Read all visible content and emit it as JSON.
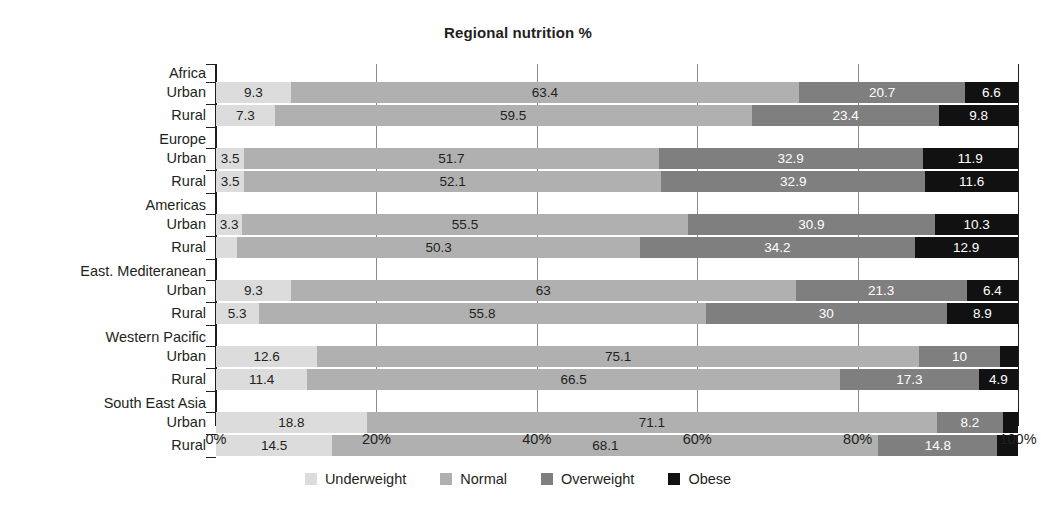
{
  "chart_data": {
    "type": "bar",
    "subtype": "stacked-horizontal-100",
    "title": "Regional nutrition %",
    "xlabel": "",
    "ylabel": "",
    "xlim": [
      0,
      100
    ],
    "xticks": [
      "0%",
      "20%",
      "40%",
      "60%",
      "80%",
      "100%"
    ],
    "xtick_values": [
      0,
      20,
      40,
      60,
      80,
      100
    ],
    "grid": true,
    "legend_position": "bottom",
    "series": [
      {
        "name": "Underweight",
        "color": "#dcdcdc",
        "values": [
          9.3,
          7.3,
          3.5,
          3.5,
          3.3,
          2.6,
          9.3,
          5.3,
          12.6,
          11.4,
          18.8,
          14.5
        ]
      },
      {
        "name": "Normal",
        "color": "#b0b0b0",
        "values": [
          63.4,
          59.5,
          51.7,
          52.1,
          55.5,
          50.3,
          63,
          55.8,
          75.1,
          66.5,
          71.1,
          68.1
        ]
      },
      {
        "name": "Overweight",
        "color": "#7f7f7f",
        "values": [
          20.7,
          23.4,
          32.9,
          32.9,
          30.9,
          34.2,
          21.3,
          30,
          10,
          17.3,
          8.2,
          14.8
        ]
      },
      {
        "name": "Obese",
        "color": "#111111",
        "values": [
          6.6,
          9.8,
          11.9,
          11.6,
          10.3,
          12.9,
          6.4,
          8.9,
          2.3,
          4.9,
          1.9,
          2.6
        ]
      }
    ],
    "groups": [
      {
        "region": "Africa",
        "rows": [
          "Urban",
          "Rural"
        ]
      },
      {
        "region": "Europe",
        "rows": [
          "Urban",
          "Rural"
        ]
      },
      {
        "region": "Americas",
        "rows": [
          "Urban",
          "Rural"
        ]
      },
      {
        "region": "East. Mediteranean",
        "rows": [
          "Urban",
          "Rural"
        ]
      },
      {
        "region": "Western Pacific",
        "rows": [
          "Urban",
          "Rural"
        ]
      },
      {
        "region": "South East Asia",
        "rows": [
          "Urban",
          "Rural"
        ]
      }
    ],
    "categories": [
      "Africa Urban",
      "Africa Rural",
      "Europe Urban",
      "Europe Rural",
      "Americas Urban",
      "Americas Rural",
      "East. Mediteranean Urban",
      "East. Mediteranean Rural",
      "Western Pacific Urban",
      "Western Pacific Rural",
      "South East Asia Urban",
      "South East Asia Rural"
    ],
    "rows": [
      {
        "label": "Urban",
        "group": "Africa",
        "segments": [
          9.3,
          63.4,
          20.7,
          6.6
        ]
      },
      {
        "label": "Rural",
        "group": "Africa",
        "segments": [
          7.3,
          59.5,
          23.4,
          9.8
        ]
      },
      {
        "label": "Urban",
        "group": "Europe",
        "segments": [
          3.5,
          51.7,
          32.9,
          11.9
        ]
      },
      {
        "label": "Rural",
        "group": "Europe",
        "segments": [
          3.5,
          52.1,
          32.9,
          11.6
        ]
      },
      {
        "label": "Urban",
        "group": "Americas",
        "segments": [
          3.3,
          55.5,
          30.9,
          10.3
        ]
      },
      {
        "label": "Rural",
        "group": "Americas",
        "segments": [
          2.6,
          50.3,
          34.2,
          12.9
        ]
      },
      {
        "label": "Urban",
        "group": "East. Mediteranean",
        "segments": [
          9.3,
          63,
          21.3,
          6.4
        ]
      },
      {
        "label": "Rural",
        "group": "East. Mediteranean",
        "segments": [
          5.3,
          55.8,
          30,
          8.9
        ]
      },
      {
        "label": "Urban",
        "group": "Western Pacific",
        "segments": [
          12.6,
          75.1,
          10,
          2.3
        ]
      },
      {
        "label": "Rural",
        "group": "Western Pacific",
        "segments": [
          11.4,
          66.5,
          17.3,
          4.9
        ]
      },
      {
        "label": "Urban",
        "group": "South East Asia",
        "segments": [
          18.8,
          71.1,
          8.2,
          1.9
        ]
      },
      {
        "label": "Rural",
        "group": "South East Asia",
        "segments": [
          14.5,
          68.1,
          14.8,
          2.6
        ]
      }
    ],
    "data_labels": [
      [
        "9.3",
        "63.4",
        "20.7",
        "6.6"
      ],
      [
        "7.3",
        "59.5",
        "23.4",
        "9.8"
      ],
      [
        "3.5",
        "51.7",
        "32.9",
        "11.9"
      ],
      [
        "3.5",
        "52.1",
        "32.9",
        "11.6"
      ],
      [
        "3.3",
        "55.5",
        "30.9",
        "10.3"
      ],
      [
        "2.6",
        "50.3",
        "34.2",
        "12.9"
      ],
      [
        "9.3",
        "63",
        "21.3",
        "6.4"
      ],
      [
        "5.3",
        "55.8",
        "30",
        "8.9"
      ],
      [
        "12.6",
        "75.1",
        "10",
        "2.3"
      ],
      [
        "11.4",
        "66.5",
        "17.3",
        "4.9"
      ],
      [
        "18.8",
        "71.1",
        "8.2",
        "1.9"
      ],
      [
        "14.5",
        "68.1",
        "14.8",
        "2.6"
      ]
    ]
  },
  "legend": {
    "items": [
      {
        "label": "Underweight",
        "color": "#dcdcdc"
      },
      {
        "label": "Normal",
        "color": "#b0b0b0"
      },
      {
        "label": "Overweight",
        "color": "#7f7f7f"
      },
      {
        "label": "Obese",
        "color": "#111111"
      }
    ]
  }
}
